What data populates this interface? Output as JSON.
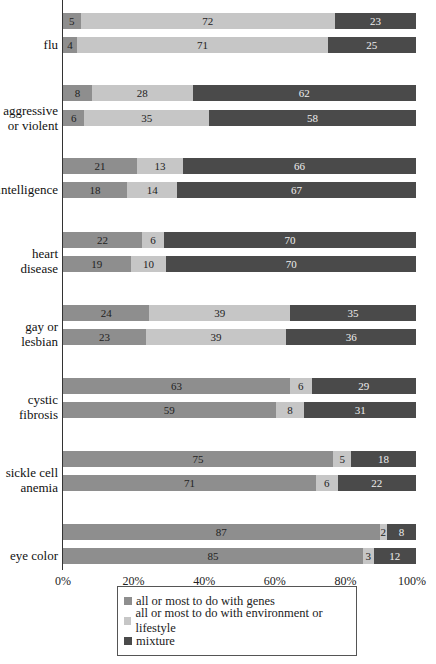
{
  "chart_data": {
    "type": "bar",
    "stacked": true,
    "orientation": "horizontal",
    "title": "",
    "xlabel": "",
    "ylabel": "",
    "xlim": [
      0,
      100
    ],
    "x_ticks": [
      "0%",
      "20%",
      "40%",
      "60%",
      "80%",
      "100%"
    ],
    "categories": [
      "flu",
      "aggressive or violent",
      "intelligence",
      "heart disease",
      "gay or lesbian",
      "cystic fibrosis",
      "sickle cell anemia",
      "eye color"
    ],
    "bars_per_category": 2,
    "series": [
      {
        "name": "all or most to do with genes",
        "color": "#8e8e8e",
        "values": [
          [
            5,
            4
          ],
          [
            8,
            6
          ],
          [
            21,
            18
          ],
          [
            22,
            19
          ],
          [
            24,
            23
          ],
          [
            63,
            59
          ],
          [
            75,
            71
          ],
          [
            87,
            85
          ]
        ]
      },
      {
        "name": "all or most to do with environment or lifestyle",
        "color": "#c6c6c6",
        "values": [
          [
            72,
            71
          ],
          [
            28,
            35
          ],
          [
            13,
            14
          ],
          [
            6,
            10
          ],
          [
            39,
            39
          ],
          [
            6,
            8
          ],
          [
            5,
            6
          ],
          [
            2,
            3
          ]
        ]
      },
      {
        "name": "mixture",
        "color": "#4a4a4a",
        "values": [
          [
            23,
            25
          ],
          [
            62,
            58
          ],
          [
            66,
            67
          ],
          [
            70,
            70
          ],
          [
            35,
            36
          ],
          [
            29,
            31
          ],
          [
            18,
            22
          ],
          [
            8,
            12
          ]
        ]
      }
    ],
    "legend_position": "bottom"
  },
  "labels": {
    "cat0": "flu",
    "cat1a": "aggressive",
    "cat1b": "or violent",
    "cat2": "intelligence",
    "cat3a": "heart",
    "cat3b": "disease",
    "cat4a": "gay or",
    "cat4b": "lesbian",
    "cat5a": "cystic",
    "cat5b": "fibrosis",
    "cat6a": "sickle cell",
    "cat6b": "anemia",
    "cat7": "eye color"
  },
  "ticks": [
    "0%",
    "20%",
    "40%",
    "60%",
    "80%",
    "100%"
  ],
  "legend": {
    "genes": "all or most to do with genes",
    "env": "all or most to do with environment or lifestyle",
    "mix": "mixture"
  }
}
